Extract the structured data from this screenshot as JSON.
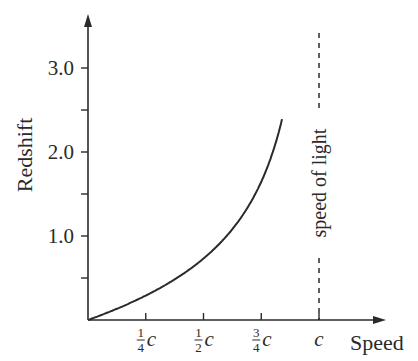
{
  "chart_data": {
    "type": "line",
    "title": "",
    "xlabel": "Speed",
    "ylabel": "Redshift",
    "xlim": [
      0,
      1.1
    ],
    "ylim": [
      0,
      3.8
    ],
    "grid": false,
    "legend": null,
    "x_ticks": [
      {
        "value": 0.25,
        "label": "1/4 c",
        "num": "1",
        "den": "4"
      },
      {
        "value": 0.5,
        "label": "1/2 c",
        "num": "1",
        "den": "2"
      },
      {
        "value": 0.75,
        "label": "3/4 c",
        "num": "3",
        "den": "4"
      },
      {
        "value": 1.0,
        "label": "c"
      }
    ],
    "y_ticks": [
      {
        "value": 0.5,
        "label": ""
      },
      {
        "value": 1.0,
        "label": "1.0"
      },
      {
        "value": 1.5,
        "label": ""
      },
      {
        "value": 2.0,
        "label": "2.0"
      },
      {
        "value": 2.5,
        "label": ""
      },
      {
        "value": 3.0,
        "label": "3.0"
      }
    ],
    "series": [
      {
        "name": "Redshift vs speed",
        "style": "solid",
        "x": [
          0,
          0.1,
          0.2,
          0.25,
          0.3,
          0.4,
          0.5,
          0.6,
          0.7,
          0.75,
          0.8,
          0.84
        ],
        "y": [
          0,
          0.106,
          0.225,
          0.291,
          0.363,
          0.528,
          0.732,
          1.0,
          1.38,
          1.646,
          2.0,
          2.391
        ]
      },
      {
        "name": "speed of light",
        "style": "dashed",
        "x": [
          1.0,
          1.0
        ],
        "y": [
          0,
          3.4
        ]
      }
    ],
    "annotations": [
      {
        "text": "speed of light",
        "x": 1.0,
        "y": 1.8,
        "rotation": -90
      }
    ],
    "c_symbol": "c"
  }
}
